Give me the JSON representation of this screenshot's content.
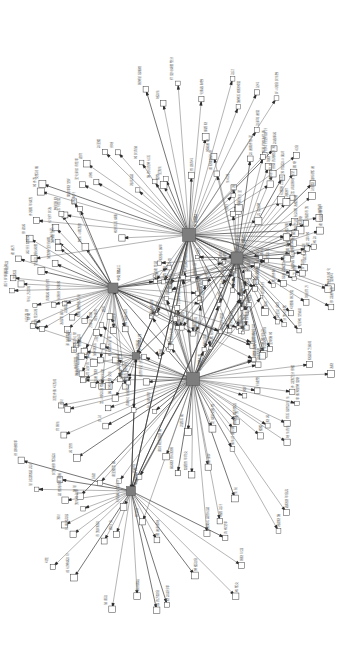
{
  "figure": {
    "title": "",
    "type": "network-graph",
    "background_color": "#ffffff",
    "hub_color": "#7d7d7d",
    "leaf_color": "#ffffff",
    "edge_color": "#5a5a5a",
    "label_color": "#6e6e6e",
    "label_orientation": "rotated-90-degrees",
    "width": 343,
    "height": 661
  },
  "chart_data": {
    "type": "scatter",
    "title": "",
    "xlabel": "",
    "ylabel": "",
    "grid": false,
    "legend": false,
    "directed": true,
    "hubs": [
      {
        "id": "h1",
        "x": 189,
        "y": 235,
        "size": 13,
        "label": "中央節點一",
        "degree": 46
      },
      {
        "id": "h2",
        "x": 237,
        "y": 258,
        "size": 12,
        "label": "中央節點二",
        "degree": 52
      },
      {
        "id": "h3",
        "x": 113,
        "y": 288,
        "size": 10,
        "label": "中央節點三",
        "degree": 34
      },
      {
        "id": "h4",
        "x": 136,
        "y": 356,
        "size": 7,
        "label": "中央節點四",
        "degree": 14
      },
      {
        "id": "h5",
        "x": 193,
        "y": 379,
        "size": 13,
        "label": "中央節點五",
        "degree": 48
      },
      {
        "id": "h6",
        "x": 131,
        "y": 491,
        "size": 9,
        "label": "中央節點六",
        "degree": 22
      }
    ],
    "leaf_count": 196,
    "edge_count": 268
  },
  "labels": {
    "sample": [
      "新聞報導節點",
      "社會議題標籤",
      "公共政策討論",
      "媒體輿論焦點",
      "地方事件記錄",
      "經濟趨勢分析",
      "文化活動資訊",
      "教育改革議題",
      "環境保護倡議",
      "科技產業動態",
      "交通建設規劃",
      "醫療衛生政策",
      "國際關係評論",
      "法律制度修訂",
      "民生物價波動",
      "城市развитие計畫",
      "青年就業方案",
      "高齡照護服務",
      "數位轉型策略",
      "能源供應調整"
    ]
  }
}
